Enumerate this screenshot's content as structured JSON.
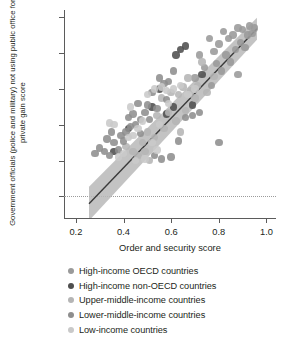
{
  "chart_data": {
    "type": "scatter",
    "title": "",
    "xlabel": "Order and security score",
    "ylabel": "Government officials (police and military) not using public office for private gain score",
    "xlim": [
      0.15,
      1.04
    ],
    "ylim": [
      -0.12,
      1.04
    ],
    "xticks": [
      0.2,
      0.4,
      0.6,
      0.8,
      1.0
    ],
    "xticklabels": [
      "0.2",
      "0.4",
      "0.6",
      "0.8",
      "1.0"
    ],
    "yticks": [
      0,
      0.2,
      0.4,
      0.6,
      0.8,
      1.0
    ],
    "yticklabels": [
      "0",
      "0.2",
      "0.4",
      "0.6",
      "0.8",
      "1.0"
    ],
    "grid": false,
    "zero_reference_line": 0,
    "legend_position": "bottom",
    "regression": {
      "type": "linear-fit-with-confidence-band",
      "line_color": "#3a3a3a",
      "band_color": "#b9b9b9",
      "x_start": 0.255,
      "x_end": 0.96,
      "y_start": -0.04,
      "y_end": 0.935
    },
    "series": [
      {
        "name": "High-income OECD countries",
        "color": "#9a9a9a",
        "points": [
          [
            0.93,
            0.95
          ],
          [
            0.95,
            0.94
          ],
          [
            0.9,
            0.93
          ],
          [
            0.92,
            0.9
          ],
          [
            0.88,
            0.94
          ],
          [
            0.86,
            0.9
          ],
          [
            0.89,
            0.86
          ],
          [
            0.84,
            0.88
          ],
          [
            0.91,
            0.83
          ],
          [
            0.87,
            0.82
          ],
          [
            0.94,
            0.91
          ],
          [
            0.82,
            0.92
          ],
          [
            0.8,
            0.85
          ],
          [
            0.83,
            0.79
          ],
          [
            0.85,
            0.75
          ],
          [
            0.79,
            0.74
          ],
          [
            0.78,
            0.81
          ],
          [
            0.76,
            0.88
          ],
          [
            0.81,
            0.7
          ],
          [
            0.74,
            0.72
          ],
          [
            0.88,
            0.68
          ],
          [
            0.72,
            0.79
          ],
          [
            0.7,
            0.66
          ],
          [
            0.77,
            0.62
          ]
        ]
      },
      {
        "name": "High-income non-OECD countries",
        "color": "#4e4e4e",
        "points": [
          [
            0.66,
            0.84
          ],
          [
            0.64,
            0.82
          ],
          [
            0.62,
            0.79
          ],
          [
            0.55,
            0.6
          ],
          [
            0.52,
            0.5
          ],
          [
            0.42,
            0.38
          ],
          [
            0.36,
            0.25
          ],
          [
            0.73,
            0.68
          ],
          [
            0.69,
            0.51
          ],
          [
            0.61,
            0.5
          ],
          [
            0.58,
            0.46
          ]
        ]
      },
      {
        "name": "Upper-middle-income countries",
        "color": "#b5b5b5",
        "points": [
          [
            0.73,
            0.75
          ],
          [
            0.71,
            0.62
          ],
          [
            0.68,
            0.59
          ],
          [
            0.65,
            0.61
          ],
          [
            0.63,
            0.57
          ],
          [
            0.6,
            0.58
          ],
          [
            0.67,
            0.66
          ],
          [
            0.75,
            0.58
          ],
          [
            0.56,
            0.55
          ],
          [
            0.59,
            0.47
          ],
          [
            0.54,
            0.45
          ],
          [
            0.57,
            0.38
          ],
          [
            0.62,
            0.42
          ],
          [
            0.53,
            0.33
          ],
          [
            0.5,
            0.36
          ],
          [
            0.48,
            0.3
          ],
          [
            0.46,
            0.23
          ],
          [
            0.51,
            0.2
          ],
          [
            0.44,
            0.25
          ],
          [
            0.78,
            0.67
          ],
          [
            0.7,
            0.55
          ],
          [
            0.66,
            0.48
          ],
          [
            0.49,
            0.25
          ],
          [
            0.41,
            0.28
          ],
          [
            0.64,
            0.36
          ]
        ]
      },
      {
        "name": "Lower-middle-income countries",
        "color": "#8e8e8e",
        "points": [
          [
            0.61,
            0.7
          ],
          [
            0.59,
            0.64
          ],
          [
            0.57,
            0.63
          ],
          [
            0.55,
            0.66
          ],
          [
            0.52,
            0.58
          ],
          [
            0.5,
            0.51
          ],
          [
            0.47,
            0.43
          ],
          [
            0.45,
            0.4
          ],
          [
            0.43,
            0.39
          ],
          [
            0.41,
            0.36
          ],
          [
            0.39,
            0.34
          ],
          [
            0.38,
            0.26
          ],
          [
            0.36,
            0.3
          ],
          [
            0.34,
            0.23
          ],
          [
            0.32,
            0.25
          ],
          [
            0.3,
            0.27
          ],
          [
            0.28,
            0.24
          ],
          [
            0.49,
            0.47
          ],
          [
            0.54,
            0.49
          ],
          [
            0.58,
            0.54
          ],
          [
            0.46,
            0.52
          ],
          [
            0.44,
            0.46
          ],
          [
            0.42,
            0.44
          ],
          [
            0.4,
            0.31
          ],
          [
            0.66,
            0.44
          ],
          [
            0.69,
            0.45
          ],
          [
            0.72,
            0.47
          ],
          [
            0.8,
            0.3
          ],
          [
            0.63,
            0.31
          ],
          [
            0.6,
            0.22
          ],
          [
            0.56,
            0.21
          ],
          [
            0.53,
            0.23
          ],
          [
            0.51,
            0.43
          ],
          [
            0.47,
            0.35
          ],
          [
            0.35,
            0.36
          ],
          [
            0.33,
            0.32
          ]
        ]
      },
      {
        "name": "Low-income countries",
        "color": "#c9c9c9",
        "points": [
          [
            0.56,
            0.61
          ],
          [
            0.53,
            0.6
          ],
          [
            0.5,
            0.57
          ],
          [
            0.48,
            0.42
          ],
          [
            0.46,
            0.38
          ],
          [
            0.44,
            0.34
          ],
          [
            0.42,
            0.33
          ],
          [
            0.4,
            0.24
          ],
          [
            0.38,
            0.22
          ],
          [
            0.36,
            0.4
          ],
          [
            0.58,
            0.59
          ],
          [
            0.61,
            0.6
          ],
          [
            0.55,
            0.4
          ],
          [
            0.52,
            0.3
          ],
          [
            0.49,
            0.21
          ],
          [
            0.45,
            0.2
          ],
          [
            0.43,
            0.5
          ],
          [
            0.59,
            0.52
          ],
          [
            0.64,
            0.62
          ],
          [
            0.67,
            0.57
          ],
          [
            0.7,
            0.6
          ],
          [
            0.34,
            0.41
          ],
          [
            0.54,
            0.26
          ]
        ]
      }
    ]
  },
  "legend": {
    "items": [
      {
        "label": "High-income OECD countries",
        "color": "#9a9a9a"
      },
      {
        "label": "High-income non-OECD countries",
        "color": "#4e4e4e"
      },
      {
        "label": "Upper-middle-income countries",
        "color": "#b5b5b5"
      },
      {
        "label": "Lower-middle-income countries",
        "color": "#8e8e8e"
      },
      {
        "label": "Low-income countries",
        "color": "#c9c9c9"
      }
    ]
  }
}
